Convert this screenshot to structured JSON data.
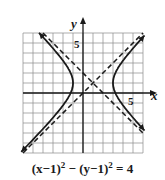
{
  "chart_data": {
    "type": "line",
    "xlabel": "x",
    "ylabel": "y",
    "xlim": [
      -6,
      6
    ],
    "ylim": [
      -6,
      6
    ],
    "grid": true,
    "tick_labels": {
      "x": [
        "5"
      ],
      "y": [
        "5"
      ]
    },
    "center": [
      1,
      1
    ],
    "a": 2,
    "b": 2,
    "vertices": [
      [
        -1,
        1
      ],
      [
        3,
        1
      ]
    ],
    "series": [
      {
        "name": "hyperbola",
        "style": "solid",
        "equation": "(x-1)^2 - (y-1)^2 = 4"
      },
      {
        "name": "asymptote-1",
        "style": "dashed",
        "equation": "y = x"
      },
      {
        "name": "asymptote-2",
        "style": "dashed",
        "equation": "y = -x + 2"
      }
    ]
  },
  "labels": {
    "x_axis": "x",
    "y_axis": "y",
    "x_tick": "5",
    "y_tick": "5",
    "eq_left": "(x−1)",
    "eq_sup1": "2",
    "eq_mid": " − (y−1)",
    "eq_sup2": "2",
    "eq_right": " = 4"
  }
}
